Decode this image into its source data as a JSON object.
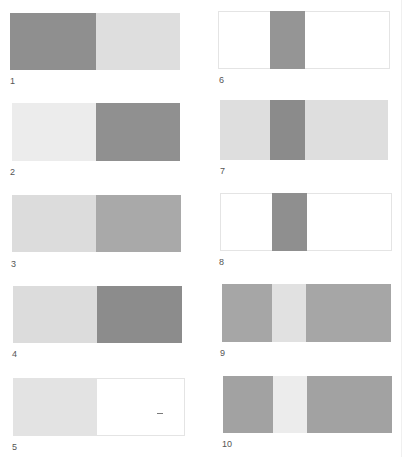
{
  "colors": {
    "dark": "#8f8f8f",
    "darker": "#888888",
    "medium": "#a9a9a9",
    "medium_gray": "#a3a3a3",
    "light": "#dcdcdc",
    "lighter": "#e9e9e9",
    "white": "#ffffff",
    "border": "#e4e4e4"
  },
  "figures": [
    {
      "label": "1",
      "description": "dark gray left half, light gray right half"
    },
    {
      "label": "2",
      "description": "very light left half, dark gray right half"
    },
    {
      "label": "3",
      "description": "light gray left half, medium gray right half"
    },
    {
      "label": "4",
      "description": "light gray left half, dark gray right half"
    },
    {
      "label": "5",
      "description": "light gray left half, white right half"
    },
    {
      "label": "6",
      "description": "white field with dark gray central stripe"
    },
    {
      "label": "7",
      "description": "light gray field with dark gray central stripe"
    },
    {
      "label": "8",
      "description": "white field with dark gray central stripe"
    },
    {
      "label": "9",
      "description": "medium gray field with light central stripe"
    },
    {
      "label": "10",
      "description": "medium gray field with light central stripe"
    }
  ]
}
